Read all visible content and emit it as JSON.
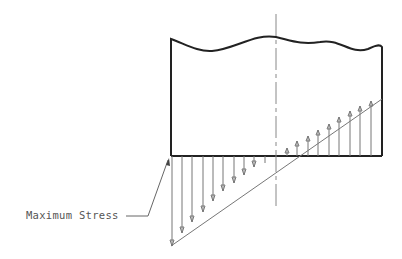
{
  "diagram": {
    "annotation": {
      "text": "Maximum Stress"
    },
    "colors": {
      "outline": "#222222",
      "arrows": "#777777",
      "centerline": "#888888",
      "text": "#555555"
    },
    "section": {
      "left_x": 171,
      "right_x": 382,
      "top_y": 39,
      "bottom_y": 156
    },
    "centerline_x": 276,
    "stress_profile": {
      "neutral_axis_x": 276,
      "compression_side": "left (downward arrows)",
      "tension_side": "right (upward arrows)",
      "max_magnitude_px": 90
    }
  }
}
